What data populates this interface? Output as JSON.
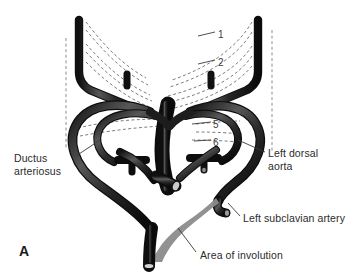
{
  "figure": {
    "panel_letter": "A",
    "title_alt": "Embryonic aortic arch system",
    "colors": {
      "vessel": "#1c1c1c",
      "vessel_highlight": "#5a5a5a",
      "vessel_midtone": "#3d3d3d",
      "involution_gray": "#8c8c8c",
      "dashed_line": "#6e6e6e",
      "leader_line": "#3a3a3a",
      "text": "#2b2b2b",
      "background": "#ffffff"
    }
  },
  "labels": {
    "ductus_arteriosus": "Ductus\narteriosus",
    "left_dorsal_aorta": "Left dorsal\naorta",
    "left_subclavian_artery": "Left subclavian artery",
    "area_of_involution": "Area of involution"
  },
  "arch_numbers": {
    "one": "1",
    "two": "2",
    "five": "5",
    "six": "6"
  }
}
